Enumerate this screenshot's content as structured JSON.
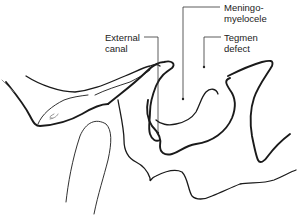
{
  "figure": {
    "type": "anatomical line drawing",
    "line_color": "#1a1a1a",
    "background": "#ffffff"
  },
  "labels": {
    "external_canal": {
      "line1": "External",
      "line2": "canal"
    },
    "meningomyelocele": {
      "line1": "Meningo-",
      "line2": "myelocele"
    },
    "tegmen_defect": {
      "line1": "Tegmen",
      "line2": "defect"
    }
  }
}
